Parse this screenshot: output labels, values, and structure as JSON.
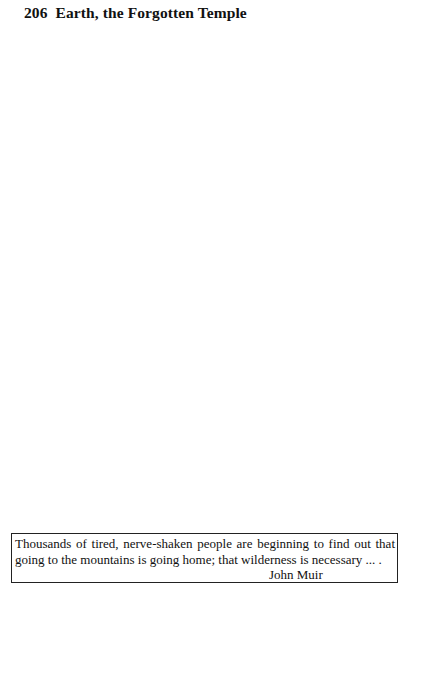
{
  "header": {
    "page_number": "206",
    "title": "Earth, the Forgotten Temple"
  },
  "quote": {
    "line1": "Thousands of tired, nerve-shaken people are beginning to find out that",
    "line2": "going to the mountains is going home; that wilderness is necessary ... .",
    "author": "John Muir"
  }
}
